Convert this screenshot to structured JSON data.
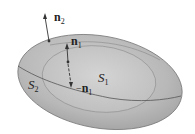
{
  "diagram": {
    "title": "",
    "surfaces": [
      {
        "id": "S2",
        "label": "S",
        "subscript": "2",
        "role": "outer surface"
      },
      {
        "id": "S1",
        "label": "S",
        "subscript": "1",
        "role": "inner surface"
      }
    ],
    "vectors": [
      {
        "id": "n2",
        "label": "n",
        "subscript": "2",
        "prefix": "",
        "direction": "outward from outer surface"
      },
      {
        "id": "n1",
        "label": "n",
        "subscript": "1",
        "prefix": "",
        "direction": "outward from inner surface"
      },
      {
        "id": "neg_n1",
        "label": "n",
        "subscript": "1",
        "prefix": "−",
        "direction": "inward into inner surface"
      }
    ],
    "colors": {
      "outer_fill": "#b9b9b9",
      "inner_fill": "#c9c9c9",
      "outline": "#6a6a6a",
      "background": "#ffffff",
      "text": "#222222"
    }
  }
}
